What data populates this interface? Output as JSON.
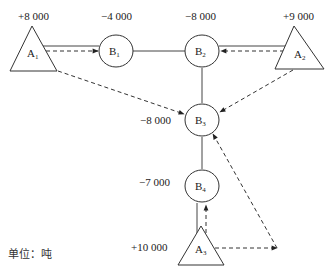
{
  "diagram": {
    "type": "transportation-network",
    "unit_label": "单位：吨",
    "supply_nodes": [
      {
        "id": "A1",
        "name": "A",
        "sub": "1",
        "value": "+8 000"
      },
      {
        "id": "A2",
        "name": "A",
        "sub": "2",
        "value": "+9 000"
      },
      {
        "id": "A3",
        "name": "A",
        "sub": "3",
        "value": "+10 000"
      }
    ],
    "demand_nodes": [
      {
        "id": "B1",
        "name": "B",
        "sub": "1",
        "value": "−4 000"
      },
      {
        "id": "B2",
        "name": "B",
        "sub": "2",
        "value": "−8 000"
      },
      {
        "id": "B3",
        "name": "B",
        "sub": "3",
        "value": "−8 000"
      },
      {
        "id": "B4",
        "name": "B",
        "sub": "4",
        "value": "−7 000"
      }
    ],
    "edges": [
      {
        "from": "A1",
        "to": "B1",
        "style": "solid"
      },
      {
        "from": "B1",
        "to": "B2",
        "style": "solid"
      },
      {
        "from": "B2",
        "to": "A2",
        "style": "solid"
      },
      {
        "from": "B2",
        "to": "B3",
        "style": "solid"
      },
      {
        "from": "B3",
        "to": "B4",
        "style": "solid"
      },
      {
        "from": "B4",
        "to": "A3",
        "style": "solid"
      }
    ],
    "flows": [
      {
        "from": "A1",
        "to": "B1",
        "style": "dashed-arrow"
      },
      {
        "from": "A1",
        "to": "B3",
        "style": "dashed-arrow"
      },
      {
        "from": "A2",
        "to": "B2",
        "style": "dashed-arrow"
      },
      {
        "from": "A2",
        "to": "B3",
        "style": "dashed-arrow"
      },
      {
        "from": "A3",
        "to": "B4",
        "style": "dashed-arrow"
      },
      {
        "from": "A3",
        "to": "B3",
        "style": "dashed-arrow",
        "via": "right-corner"
      }
    ]
  }
}
